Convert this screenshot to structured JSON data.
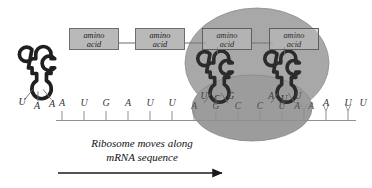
{
  "figure": {
    "caption": "Ribosome moves along\nmRNA sequence",
    "background_color": "#ffffff",
    "ribosome_color": "#a6a6a6",
    "ribosome_color_lower": "#9a9a9a",
    "amino_acid_box_color": "#b9b9b9",
    "line_color": "#8a8a8a",
    "text_color": "#1c1c1c"
  },
  "amino_acids": [
    {
      "id": "aa1",
      "label": "amino\nacid",
      "inside_ribosome": false
    },
    {
      "id": "aa2",
      "label": "amino\nacid",
      "inside_ribosome": false
    },
    {
      "id": "aa3",
      "label": "amino\nacid",
      "inside_ribosome": true
    },
    {
      "id": "aa4",
      "label": "amino\nacid",
      "inside_ribosome": true
    }
  ],
  "mrna": {
    "label": "mRNA sequence",
    "left_bases": [
      "A",
      "U",
      "G",
      "A",
      "U",
      "U"
    ],
    "codon_bases": [
      "A",
      "G",
      "C",
      "C",
      "U",
      "A",
      "A"
    ],
    "right_bases": [
      "A",
      "U",
      "U"
    ]
  },
  "trnas": [
    {
      "id": "trna-free",
      "state": "released",
      "anticodon": [
        "U",
        "A",
        "A"
      ],
      "carries_amino_acid": false
    },
    {
      "id": "trna-p-site",
      "state": "bound",
      "anticodon": [
        "U",
        "C",
        "G"
      ],
      "carries_amino_acid": true
    },
    {
      "id": "trna-a-site",
      "state": "bound",
      "anticodon": [
        "A",
        "U",
        "U"
      ],
      "carries_amino_acid": true
    }
  ],
  "arrow": {
    "direction": "right",
    "meaning": "Ribosome moves along mRNA sequence"
  }
}
